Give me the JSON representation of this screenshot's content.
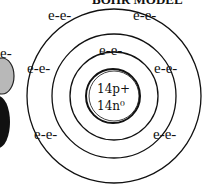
{
  "title": "BOHR MODEL",
  "nucleus": {
    "protons": "14p+",
    "neutrons": "14n⁰"
  },
  "shells": [
    {
      "name": "shell-1",
      "electrons": [
        "e-e-"
      ]
    },
    {
      "name": "shell-2",
      "electrons": [
        "e-e-",
        "e-e-",
        "e-e-",
        "e-e-"
      ]
    },
    {
      "name": "shell-3",
      "electrons": [
        "e-e-",
        "e-e-"
      ]
    }
  ],
  "labels": {
    "shell1_top": "e-e-",
    "shell2_left": "e-e-",
    "shell2_right": "e-e-",
    "shell2_bottom_left": "e-e-",
    "shell2_bottom_right": "e-e-",
    "shell3_top_left": "e-e-",
    "shell3_top_right": "e-e-",
    "partial_left": "e-"
  },
  "colors": {
    "line": "#111111",
    "background": "#ffffff",
    "partial_atom_fill": "#b0b0b0"
  }
}
